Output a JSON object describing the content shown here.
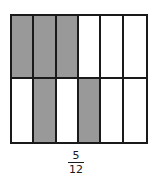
{
  "diagram": {
    "rows": 2,
    "cols": 6,
    "shaded": [
      [
        true,
        true,
        true,
        false,
        false,
        false
      ],
      [
        false,
        true,
        false,
        true,
        false,
        false
      ]
    ],
    "colors": {
      "shaded": "#999999",
      "empty": "#ffffff",
      "border": "#1a1a1a"
    }
  },
  "fraction": {
    "numerator": "5",
    "denominator": "12"
  }
}
